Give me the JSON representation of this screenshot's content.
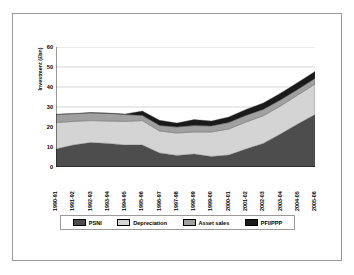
{
  "figure": {
    "background_color": "#ffffff",
    "border_color": "#9a9a9a"
  },
  "chart_data": {
    "type": "area",
    "stacked": true,
    "title": "",
    "xlabel": "",
    "ylabel": "Investment (£bn)",
    "ylim": [
      0,
      60
    ],
    "yticks": [
      0,
      10,
      20,
      30,
      40,
      50,
      60
    ],
    "ytick_labels": [
      "0",
      "10",
      "20",
      "30",
      "40",
      "50",
      "60"
    ],
    "grid": true,
    "grid_axis": "y",
    "legend_position": "below-axis",
    "categories": [
      "1990-91",
      "1991-92",
      "1992-93",
      "1993-94",
      "1994-95",
      "1995-96",
      "1996-97",
      "1997-98",
      "1998-99",
      "1999-00",
      "2000-01",
      "2001-02",
      "2002-03",
      "2003-04",
      "2004-05",
      "2005-06"
    ],
    "series": [
      {
        "name": "PSNI",
        "color": "#4d4d4d",
        "values": [
          9.0,
          11.0,
          12.2,
          11.8,
          11.0,
          11.0,
          7.0,
          5.8,
          6.5,
          5.3,
          6.0,
          9.0,
          11.8,
          16.5,
          21.5,
          26.2
        ]
      },
      {
        "name": "Depreciation",
        "color": "#d4d4d4",
        "values": [
          13.2,
          11.8,
          11.0,
          11.2,
          11.8,
          12.2,
          11.0,
          11.2,
          11.0,
          12.2,
          13.0,
          13.5,
          13.8,
          14.0,
          14.5,
          15.3
        ]
      },
      {
        "name": "Asset sales",
        "color": "#a0a0a0",
        "values": [
          4.0,
          3.8,
          3.8,
          3.8,
          3.4,
          2.6,
          2.8,
          3.0,
          3.2,
          3.0,
          3.2,
          3.3,
          3.2,
          3.0,
          2.8,
          2.8
        ]
      },
      {
        "name": "PFI/PPP",
        "color": "#1a1a1a",
        "values": [
          0.2,
          0.2,
          0.2,
          0.2,
          0.3,
          2.2,
          2.6,
          2.0,
          3.0,
          2.5,
          2.8,
          3.0,
          3.2,
          3.4,
          3.5,
          3.5
        ]
      }
    ],
    "totals": [
      26.4,
      26.8,
      27.2,
      27.0,
      26.5,
      28.0,
      23.4,
      22.0,
      23.7,
      23.0,
      25.0,
      28.8,
      32.0,
      36.9,
      42.3,
      47.8
    ]
  },
  "legend": {
    "items": [
      {
        "label": "PSNI",
        "color": "#4d4d4d"
      },
      {
        "label": "Depreciation",
        "color": "#d4d4d4"
      },
      {
        "label": "Asset sales",
        "color": "#a0a0a0"
      },
      {
        "label": "PFI/PPP",
        "color": "#1a1a1a"
      }
    ]
  }
}
